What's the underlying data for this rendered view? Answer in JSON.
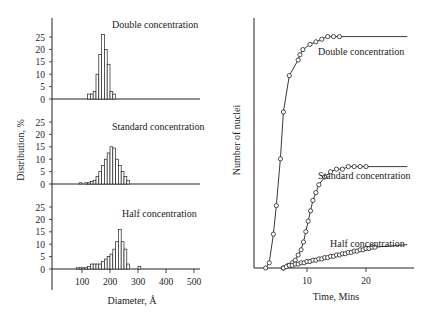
{
  "chart_data": [
    {
      "type": "bar",
      "title": "Double concentration",
      "xlabel": "Diameter, Å",
      "ylabel": "Distribution, %",
      "ylim": [
        0,
        25
      ],
      "yticks": [
        0,
        5,
        10,
        15,
        20,
        25
      ],
      "bin_width": 10,
      "bins_start": [
        120,
        130,
        140,
        150,
        160,
        170,
        180,
        190,
        200
      ],
      "values": [
        2,
        2,
        3,
        10,
        18,
        26,
        20,
        14,
        3
      ],
      "extra_bins": [
        {
          "start": 210,
          "value": 2
        }
      ]
    },
    {
      "type": "bar",
      "title": "Standard concentration",
      "xlabel": "Diameter, Å",
      "ylabel": "Distribution, %",
      "ylim": [
        0,
        25
      ],
      "yticks": [
        0,
        5,
        10,
        15,
        20,
        25
      ],
      "bin_width": 10,
      "bins_start": [
        90,
        110,
        120,
        130,
        140,
        150,
        160,
        170,
        180,
        190,
        200,
        210,
        220,
        230,
        240,
        250,
        260
      ],
      "values": [
        0.5,
        0.5,
        0.5,
        1,
        1.5,
        3,
        5,
        7.5,
        10,
        12.5,
        15,
        14.5,
        10,
        7.5,
        5,
        3,
        1.5
      ]
    },
    {
      "type": "bar",
      "title": "Half concentration",
      "xlabel": "Diameter, Å",
      "ylabel": "Distribution, %",
      "ylim": [
        0,
        25
      ],
      "yticks": [
        0,
        5,
        10,
        15,
        20,
        25
      ],
      "xticks": [
        100,
        200,
        300,
        400,
        500
      ],
      "xlim": [
        0,
        520
      ],
      "bin_width": 10,
      "bins_start": [
        80,
        90,
        100,
        110,
        120,
        130,
        140,
        150,
        160,
        170,
        180,
        190,
        200,
        210,
        220,
        230,
        240,
        250,
        260,
        300
      ],
      "values": [
        0.5,
        0.5,
        0.5,
        0.5,
        1,
        2,
        2,
        2,
        2,
        3,
        4,
        5,
        6,
        8,
        11,
        16,
        11,
        8,
        2,
        1
      ]
    },
    {
      "type": "line",
      "title": "",
      "xlabel": "Time, Mins",
      "ylabel": "Number of nuclei",
      "xticks": [
        10,
        20
      ],
      "xlim": [
        0,
        28
      ],
      "series": [
        {
          "name": "Double concentration",
          "x": [
            3.0,
            3.6,
            4.3,
            4.8,
            5.5,
            6.0,
            7.0,
            8.5,
            8.8,
            9.3,
            10.5,
            11.5,
            12.5,
            13.5,
            14.5,
            15.5
          ],
          "y": [
            0,
            2,
            13,
            24,
            42,
            60,
            74,
            80,
            82,
            84,
            86,
            87,
            88,
            89,
            89,
            89
          ]
        },
        {
          "name": "Standard concentration",
          "x": [
            6.0,
            6.8,
            7.5,
            8.0,
            8.5,
            9.0,
            9.4,
            9.8,
            10.2,
            10.6,
            11.0,
            11.5,
            12.0,
            13.0,
            14.0,
            15.0,
            16.0,
            17.0,
            18.0,
            19.0,
            20.0
          ],
          "y": [
            0,
            1,
            2,
            3,
            5,
            7,
            10,
            14,
            18,
            22,
            26,
            29,
            32,
            35,
            37,
            38,
            38,
            39,
            39,
            39,
            39
          ]
        },
        {
          "name": "Half concentration",
          "x": [
            6.0,
            6.5,
            7.0,
            7.5,
            8.0,
            8.5,
            9.0,
            9.5,
            10.0,
            10.5,
            11.0,
            11.5,
            12.0,
            12.5,
            13.0,
            13.5,
            14.0,
            14.5,
            15.0,
            15.5,
            16.0,
            16.5,
            17.0,
            17.5,
            18.0,
            18.5,
            19.0,
            19.5,
            20.0,
            20.5,
            21.0,
            21.5
          ],
          "y": [
            0,
            0.5,
            1,
            1,
            1.5,
            1.5,
            2,
            2,
            2.5,
            2.5,
            3,
            3,
            3.5,
            3.5,
            4,
            4,
            4.5,
            4.5,
            5,
            5,
            5.5,
            5.5,
            6,
            6,
            6.5,
            6.5,
            7,
            7,
            7.5,
            7.5,
            8,
            8
          ]
        }
      ]
    }
  ],
  "labels": {
    "double": "Double concentration",
    "standard": "Standard concentration",
    "half": "Half concentration",
    "left_ylabel": "Distribution, %",
    "left_xlabel": "Diameter, Å",
    "right_ylabel": "Number of nuclei",
    "right_xlabel": "Time, Mins",
    "r_double": "Double concentration",
    "r_standard": "Standard concentration",
    "r_half": "Half concentration"
  }
}
